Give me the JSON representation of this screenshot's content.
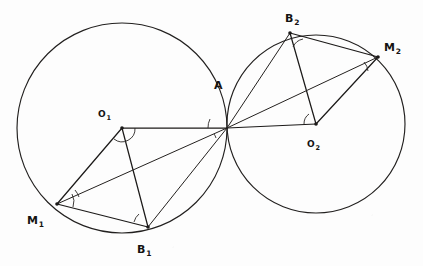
{
  "figure": {
    "background_color": "#fdfdfd",
    "ink_color": "#1c1a19",
    "width": 423,
    "height": 266
  },
  "chart_data": {
    "type": "diagram",
    "subtype": "euclidean-geometry-construction",
    "title": "",
    "coordinate_system": {
      "origin": "top-left",
      "x_range": [
        0,
        423
      ],
      "y_range": [
        0,
        266
      ],
      "units": "pixels"
    },
    "circles": [
      {
        "name": "circle-1",
        "center_label": "O1",
        "cx": 122,
        "cy": 128,
        "r": 105
      },
      {
        "name": "circle-2",
        "center_label": "O2",
        "cx": 316,
        "cy": 124,
        "r": 89
      }
    ],
    "points": [
      {
        "id": "A",
        "label": "A",
        "subscript": "",
        "x": 227,
        "y": 128,
        "label_x": 214,
        "label_y": 76,
        "marked": false
      },
      {
        "id": "O1",
        "label": "O",
        "subscript": "1",
        "x": 122,
        "y": 128,
        "label_x": 98,
        "label_y": 104,
        "marked": true
      },
      {
        "id": "M1",
        "label": "M",
        "subscript": "1",
        "x": 57,
        "y": 204,
        "label_x": 27,
        "label_y": 211,
        "marked": true
      },
      {
        "id": "B1",
        "label": "B",
        "subscript": "1",
        "x": 148,
        "y": 227,
        "label_x": 137,
        "label_y": 240,
        "marked": true
      },
      {
        "id": "O2",
        "label": "O",
        "subscript": "2",
        "x": 316,
        "y": 124,
        "label_x": 307,
        "label_y": 134,
        "marked": true
      },
      {
        "id": "B2",
        "label": "B",
        "subscript": "2",
        "x": 290,
        "y": 33,
        "label_x": 285,
        "label_y": 9,
        "marked": true
      },
      {
        "id": "M2",
        "label": "M",
        "subscript": "2",
        "x": 378,
        "y": 57,
        "label_x": 384,
        "label_y": 38,
        "marked": true
      }
    ],
    "segments": [
      {
        "name": "O1-A",
        "from": "O1",
        "to": "A",
        "weight": "thick"
      },
      {
        "name": "A-O2",
        "from": "A",
        "to": "O2",
        "weight": "thick"
      },
      {
        "name": "O1-M1",
        "from": "O1",
        "to": "M1",
        "weight": "thick"
      },
      {
        "name": "O1-B1",
        "from": "O1",
        "to": "B1",
        "weight": "thick"
      },
      {
        "name": "M1-B1",
        "from": "M1",
        "to": "B1",
        "weight": "thick"
      },
      {
        "name": "A-M1",
        "from": "A",
        "to": "M1",
        "weight": "thin"
      },
      {
        "name": "A-B1",
        "from": "A",
        "to": "B1",
        "weight": "thin"
      },
      {
        "name": "O2-B2",
        "from": "O2",
        "to": "B2",
        "weight": "thick"
      },
      {
        "name": "O2-M2",
        "from": "O2",
        "to": "M2",
        "weight": "thick"
      },
      {
        "name": "B2-M2",
        "from": "B2",
        "to": "M2",
        "weight": "thick"
      },
      {
        "name": "A-B2",
        "from": "A",
        "to": "B2",
        "weight": "thin"
      },
      {
        "name": "A-M2",
        "from": "A",
        "to": "M2",
        "weight": "thin"
      }
    ],
    "angle_marks": [
      {
        "name": "angle-at-O1",
        "vertex": "O1",
        "radius": 13
      },
      {
        "name": "angle-at-M1-upper",
        "vertex": "M1",
        "radius": 22
      },
      {
        "name": "angle-at-M1-lower",
        "vertex": "M1",
        "radius": 16
      },
      {
        "name": "angle-at-B1",
        "vertex": "B1",
        "radius": 15
      },
      {
        "name": "angle-at-A-left",
        "vertex": "A",
        "radius": 19
      },
      {
        "name": "angle-at-A-right",
        "vertex": "A",
        "radius": 13
      },
      {
        "name": "angle-at-O2",
        "vertex": "O2",
        "radius": 12
      },
      {
        "name": "angle-at-B2",
        "vertex": "B2",
        "radius": 14
      },
      {
        "name": "angle-at-M2",
        "vertex": "M2",
        "radius": 15
      }
    ]
  }
}
